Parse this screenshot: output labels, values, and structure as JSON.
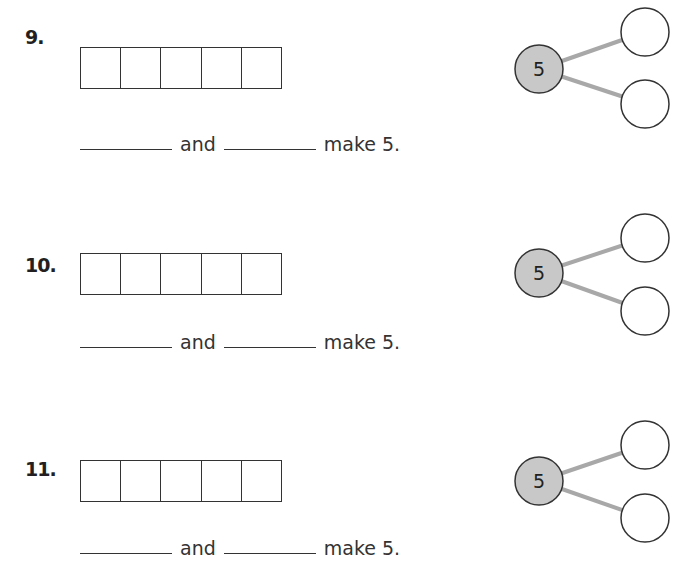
{
  "worksheet": {
    "problems": [
      {
        "number": "9.",
        "ten_frame_cells": 5,
        "sentence": {
          "connector": "and",
          "ending": "make 5."
        },
        "number_bond": {
          "whole": "5",
          "parts": [
            "",
            ""
          ]
        }
      },
      {
        "number": "10.",
        "ten_frame_cells": 5,
        "sentence": {
          "connector": "and",
          "ending": "make 5."
        },
        "number_bond": {
          "whole": "5",
          "parts": [
            "",
            ""
          ]
        }
      },
      {
        "number": "11.",
        "ten_frame_cells": 5,
        "sentence": {
          "connector": "and",
          "ending": "make 5."
        },
        "number_bond": {
          "whole": "5",
          "parts": [
            "",
            ""
          ]
        }
      }
    ],
    "colors": {
      "whole_circle_fill": "#c8c8c8",
      "connector_line": "#a8a8a8",
      "stroke": "#333333"
    }
  }
}
